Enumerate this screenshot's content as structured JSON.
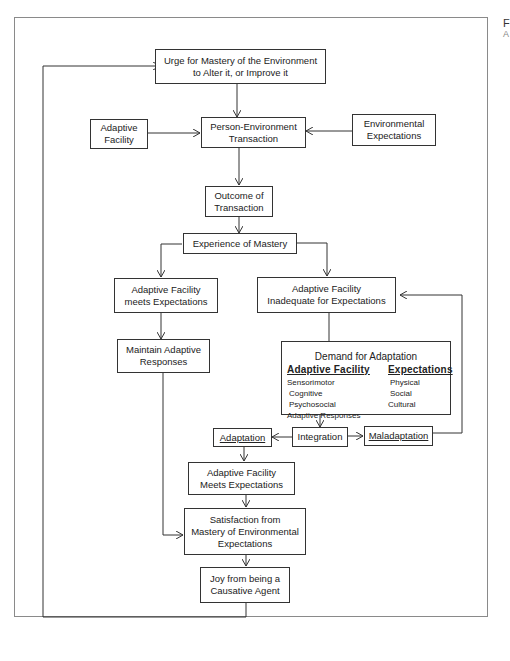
{
  "figure": {
    "label_initial": "F",
    "label_initial2": "A"
  },
  "nodes": {
    "urge": [
      "Urge for Mastery of the Environment",
      "to Alter it, or Improve it"
    ],
    "adaptive_facility": [
      "Adaptive",
      "Facility"
    ],
    "transaction": [
      "Person-Environment",
      "Transaction"
    ],
    "env_expectations": [
      "Environmental",
      "Expectations"
    ],
    "outcome": [
      "Outcome of",
      "Transaction"
    ],
    "experience": [
      "Experience of Mastery"
    ],
    "meets": [
      "Adaptive Facility",
      "meets Expectations"
    ],
    "inadequate": [
      "Adaptive Facility",
      "Inadequate for Expectations"
    ],
    "maintain": [
      "Maintain Adaptive",
      "Responses"
    ],
    "demand": {
      "title": "Demand for Adaptation",
      "left_header": "Adaptive Facility",
      "left_items": [
        "Sensorimotor",
        "Cognitive",
        "Psychosocial",
        "Adaptive Responses"
      ],
      "right_header": "Expectations",
      "right_items": [
        "Physical",
        "Social",
        "Cultural"
      ]
    },
    "adaptation": "Adaptation",
    "integration": "Integration",
    "maladaptation": "Maladaptation",
    "meets2": [
      "Adaptive Facility",
      "Meets Expectations"
    ],
    "satisfaction": [
      "Satisfaction from",
      "Mastery of Environmental",
      "Expectations"
    ],
    "joy": [
      "Joy from being a",
      "Causative Agent"
    ]
  },
  "colors": {
    "line": "#333333",
    "frame": "#8a8a8a",
    "background": "#ffffff"
  }
}
